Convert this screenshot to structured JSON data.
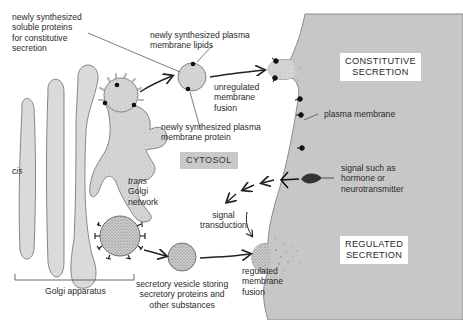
{
  "diagram": {
    "type": "cell-biology-secretory-pathways",
    "colors": {
      "extracellular": "#c8c8c8",
      "organelle_fill": "#d9d9d9",
      "vesicle_fill": "#d4d4d4",
      "outline": "#6a6a6a",
      "protein_dot": "#111111",
      "text": "#2a2a2a",
      "background": "#ffffff"
    },
    "labels": {
      "soluble_proteins": [
        "newly synthesized",
        "soluble proteins",
        "for constitutive",
        "secretion"
      ],
      "membrane_lipids": [
        "newly synthesized plasma",
        "membrane lipids"
      ],
      "membrane_protein": [
        "newly synthesized plasma",
        "membrane protein"
      ],
      "unregulated_fusion": [
        "unregulated",
        "membrane",
        "fusion"
      ],
      "constitutive_secretion": [
        "CONSTITUTIVE",
        "SECRETION"
      ],
      "plasma_membrane": "plasma membrane",
      "signal": [
        "signal such as",
        "hormone or",
        "neurotransmitter"
      ],
      "cytosol": "CYTOSOL",
      "cis": "cis",
      "trans_golgi": [
        "trans",
        "Golgi",
        "network"
      ],
      "signal_transduction": [
        "signal",
        "transduction"
      ],
      "regulated_secretion": [
        "REGULATED",
        "SECRETION"
      ],
      "regulated_fusion": [
        "regulated",
        "membrane",
        "fusion"
      ],
      "secretory_vesicle": [
        "secretory vesicle storing",
        "secretory proteins and",
        "other substances"
      ],
      "golgi_apparatus": "Golgi apparatus"
    }
  }
}
